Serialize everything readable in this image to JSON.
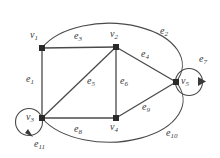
{
  "figure": {
    "name": "directed-multigraph-diagram",
    "background": "#ffffff",
    "stroke_color": "#4a4a4a",
    "label_color": "#3a3a3a",
    "width": 220,
    "height": 158
  },
  "vertices": [
    {
      "id": "v1",
      "base": "v",
      "sub": "1",
      "x": 42,
      "y": 48,
      "label_x": 30,
      "label_y": 30
    },
    {
      "id": "v2",
      "base": "v",
      "sub": "2",
      "x": 116,
      "y": 47,
      "label_x": 110,
      "label_y": 29
    },
    {
      "id": "v3",
      "base": "v",
      "sub": "3",
      "x": 42,
      "y": 118,
      "label_x": 26,
      "label_y": 112
    },
    {
      "id": "v4",
      "base": "v",
      "sub": "4",
      "x": 116,
      "y": 118,
      "label_x": 110,
      "label_y": 122
    },
    {
      "id": "v5",
      "base": "v",
      "sub": "5",
      "x": 176,
      "y": 82,
      "label_x": 181,
      "label_y": 76
    }
  ],
  "edges": [
    {
      "id": "e1",
      "base": "e",
      "sub": "1",
      "from": "v1",
      "to": "v3",
      "kind": "line",
      "label_x": 26,
      "label_y": 74
    },
    {
      "id": "e2",
      "base": "e",
      "sub": "2",
      "from": "v1",
      "to": "v5",
      "kind": "arc",
      "label_x": 160,
      "label_y": 26
    },
    {
      "id": "e3",
      "base": "e",
      "sub": "3",
      "from": "v1",
      "to": "v2",
      "kind": "line",
      "label_x": 74,
      "label_y": 31
    },
    {
      "id": "e4",
      "base": "e",
      "sub": "4",
      "from": "v2",
      "to": "v5",
      "kind": "line",
      "label_x": 141,
      "label_y": 49
    },
    {
      "id": "e5",
      "base": "e",
      "sub": "5",
      "from": "v2",
      "to": "v3",
      "kind": "line",
      "label_x": 87,
      "label_y": 76
    },
    {
      "id": "e6",
      "base": "e",
      "sub": "6",
      "from": "v2",
      "to": "v4",
      "kind": "line",
      "label_x": 120,
      "label_y": 76
    },
    {
      "id": "e7",
      "base": "e",
      "sub": "7",
      "from": "v5",
      "to": "v5",
      "kind": "loop",
      "label_x": 199,
      "label_y": 54
    },
    {
      "id": "e8",
      "base": "e",
      "sub": "8",
      "from": "v3",
      "to": "v4",
      "kind": "line",
      "label_x": 74,
      "label_y": 124
    },
    {
      "id": "e9",
      "base": "e",
      "sub": "9",
      "from": "v4",
      "to": "v5",
      "kind": "line",
      "label_x": 142,
      "label_y": 102
    },
    {
      "id": "e10",
      "base": "e",
      "sub": "10",
      "from": "v3",
      "to": "v5",
      "kind": "arc",
      "label_x": 166,
      "label_y": 128
    },
    {
      "id": "e11",
      "base": "e",
      "sub": "11",
      "from": "v3",
      "to": "v3",
      "kind": "loop",
      "label_x": 34,
      "label_y": 139
    }
  ]
}
